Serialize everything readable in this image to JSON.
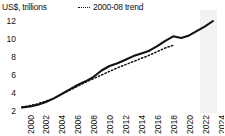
{
  "chart_data": {
    "type": "line",
    "title": "",
    "ylabel": "US$, trillions",
    "xlabel": "",
    "ylim": [
      2,
      12
    ],
    "xlim": [
      2000,
      2024
    ],
    "yticks": [
      12,
      10,
      8,
      6,
      4,
      2
    ],
    "xticks": [
      2000,
      2002,
      2004,
      2006,
      2008,
      2010,
      2012,
      2014,
      2016,
      2018,
      2020,
      2022,
      2024
    ],
    "grid": false,
    "legend_position": "top-center",
    "legend": [
      "2000-08 trend"
    ],
    "forecast_band": {
      "label": "",
      "start_x": 2022.4,
      "end_x": 2024.5
    },
    "series": [
      {
        "name": "actual",
        "style": "solid",
        "color": "#111111",
        "x": [
          2000,
          2001,
          2002,
          2003,
          2004,
          2005,
          2006,
          2007,
          2008,
          2009,
          2010,
          2011,
          2012,
          2013,
          2014,
          2015,
          2016,
          2017,
          2018,
          2019,
          2020,
          2021,
          2022,
          2023,
          2024
        ],
        "values": [
          2.4,
          2.5,
          2.7,
          3.0,
          3.4,
          3.9,
          4.4,
          4.9,
          5.3,
          5.8,
          6.5,
          7.0,
          7.3,
          7.7,
          8.1,
          8.4,
          8.7,
          9.2,
          9.8,
          10.3,
          10.1,
          10.4,
          10.9,
          11.4,
          12.0
        ]
      },
      {
        "name": "2000-08 trend",
        "style": "dotted",
        "color": "#111111",
        "x": [
          2000,
          2002,
          2004,
          2006,
          2008,
          2010,
          2012,
          2014,
          2016,
          2018,
          2019
        ],
        "values": [
          2.4,
          2.8,
          3.4,
          4.3,
          5.2,
          6.0,
          6.8,
          7.5,
          8.2,
          9.0,
          9.3
        ]
      }
    ]
  },
  "axis": {
    "y_label_text": "US$, trillions",
    "y_tick_labels": [
      "12",
      "10",
      "8",
      "6",
      "4",
      "2"
    ],
    "x_tick_labels": [
      "2000",
      "2002",
      "2004",
      "2006",
      "2008",
      "2010",
      "2012",
      "2014",
      "2016",
      "2018",
      "2020",
      "2022",
      "2024"
    ]
  },
  "legend": {
    "trend_label": "2000-08 trend"
  },
  "colors": {
    "line": "#111111",
    "band": "#f2f2f2",
    "text": "#111111"
  }
}
